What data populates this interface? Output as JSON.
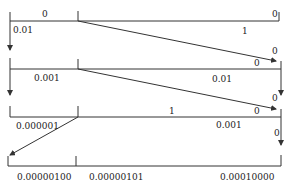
{
  "diagram": {
    "title": "",
    "colors": {
      "line": "#333333",
      "text": "#222222",
      "background": "#ffffff"
    },
    "rows": [
      {
        "id": "row1",
        "labels": {
          "left_top": "0",
          "left_bottom": "0.01",
          "right_top": "0",
          "right_bottom": "1",
          "arrow_label": "0"
        }
      },
      {
        "id": "row2",
        "labels": {
          "left_bottom": "0.001",
          "right_top_near_arrow": "0",
          "right_bottom": "0.01",
          "arrow_label": "0"
        }
      },
      {
        "id": "row3",
        "labels": {
          "left_bottom": "0.000001",
          "right_top_mid": "1",
          "right_top_near_arrow": "0",
          "right_bottom": "0.001",
          "down_arrow_label": "0"
        }
      },
      {
        "id": "row4",
        "labels": {
          "seg1": "0.00000100",
          "seg2": "0.00000101",
          "seg3": "0.00010000"
        }
      }
    ]
  }
}
